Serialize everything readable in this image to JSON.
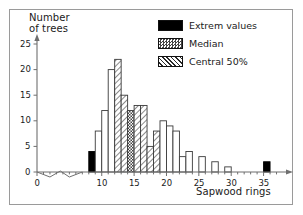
{
  "chart_data": {
    "type": "bar",
    "title": "",
    "xlabel": "Sapwood rings",
    "ylabel": "Number of trees",
    "ylabel_line1": "Number",
    "ylabel_line2": "of trees",
    "xlim": [
      0,
      38
    ],
    "ylim": [
      0,
      26
    ],
    "yticks": [
      0,
      5,
      10,
      15,
      20,
      25
    ],
    "xticks": [
      0,
      10,
      15,
      20,
      25,
      30,
      35
    ],
    "grid": false,
    "legend_position": "top-right",
    "bin_width": 1,
    "categories": [
      7,
      8,
      9,
      10,
      11,
      12,
      13,
      14,
      15,
      16,
      17,
      18,
      19,
      20,
      21,
      22,
      23,
      24,
      25,
      26,
      27,
      28,
      29,
      30,
      35,
      36
    ],
    "values": [
      0,
      4,
      8,
      12,
      20,
      22,
      15,
      12,
      13,
      13,
      5,
      8,
      10,
      9,
      8,
      3,
      4,
      0,
      3,
      0,
      2,
      0,
      1,
      0,
      0,
      2
    ],
    "bars": [
      {
        "x": 8,
        "value": 4,
        "fill": "extreme"
      },
      {
        "x": 9,
        "value": 8,
        "fill": "plain"
      },
      {
        "x": 10,
        "value": 12,
        "fill": "plain"
      },
      {
        "x": 11,
        "value": 20,
        "fill": "plain"
      },
      {
        "x": 12,
        "value": 22,
        "fill": "central"
      },
      {
        "x": 13,
        "value": 15,
        "fill": "central"
      },
      {
        "x": 14,
        "value": 12,
        "fill": "median"
      },
      {
        "x": 15,
        "value": 13,
        "fill": "central"
      },
      {
        "x": 16,
        "value": 13,
        "fill": "central"
      },
      {
        "x": 17,
        "value": 5,
        "fill": "central"
      },
      {
        "x": 18,
        "value": 8,
        "fill": "central"
      },
      {
        "x": 19,
        "value": 10,
        "fill": "plain"
      },
      {
        "x": 20,
        "value": 9,
        "fill": "plain"
      },
      {
        "x": 21,
        "value": 8,
        "fill": "plain"
      },
      {
        "x": 22,
        "value": 3,
        "fill": "plain"
      },
      {
        "x": 23,
        "value": 4,
        "fill": "plain"
      },
      {
        "x": 25,
        "value": 3,
        "fill": "plain"
      },
      {
        "x": 27,
        "value": 2,
        "fill": "plain"
      },
      {
        "x": 29,
        "value": 1,
        "fill": "plain"
      },
      {
        "x": 35,
        "value": 2,
        "fill": "extreme"
      }
    ],
    "legend": [
      {
        "key": "extreme",
        "label": "Extrem values",
        "pattern": "solid-black",
        "color": "#000000"
      },
      {
        "key": "median",
        "label": "Median",
        "pattern": "stipple",
        "color": "#555555"
      },
      {
        "key": "central",
        "label": "Central 50%",
        "pattern": "diagonal-hatch",
        "color": "#333333"
      }
    ],
    "colors": {
      "axis": "#6f6f6f",
      "bar_outline": "#3a3a3a",
      "bar_fill_plain": "#ffffff",
      "extreme": "#000000",
      "frame": "#9a9a9a",
      "text": "#1a1a1a"
    }
  }
}
